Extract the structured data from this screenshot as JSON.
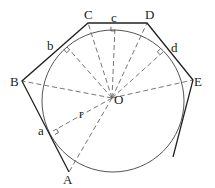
{
  "diagram": {
    "colors": {
      "stroke": "#222222",
      "circle": "#555555",
      "dashed": "#666666",
      "background": "#ffffff"
    },
    "center": {
      "label": "O",
      "x": 112,
      "y": 98
    },
    "circle": {
      "cx": 113,
      "cy": 101,
      "r": 71
    },
    "radius_label": {
      "label": "r",
      "x": 79,
      "y": 118
    },
    "vertices": [
      {
        "label": "A",
        "x": 69,
        "y": 172,
        "lx": 63,
        "ly": 184
      },
      {
        "label": "B",
        "x": 22,
        "y": 81,
        "lx": 10,
        "ly": 86
      },
      {
        "label": "C",
        "x": 88,
        "y": 23,
        "lx": 84,
        "ly": 19
      },
      {
        "label": "D",
        "x": 147,
        "y": 23,
        "lx": 145,
        "ly": 19
      },
      {
        "label": "E",
        "x": 193,
        "y": 80,
        "lx": 194,
        "ly": 86
      }
    ],
    "tangent_points": [
      {
        "label": "a",
        "x": 53,
        "y": 131,
        "lx": 38,
        "ly": 135
      },
      {
        "label": "b",
        "x": 67,
        "y": 47,
        "lx": 47,
        "ly": 50
      },
      {
        "label": "c",
        "x": 115,
        "y": 27,
        "lx": 111,
        "ly": 22
      },
      {
        "label": "d",
        "x": 163,
        "y": 52,
        "lx": 171,
        "ly": 52
      }
    ],
    "open_end": {
      "x": 173,
      "y": 157
    }
  }
}
